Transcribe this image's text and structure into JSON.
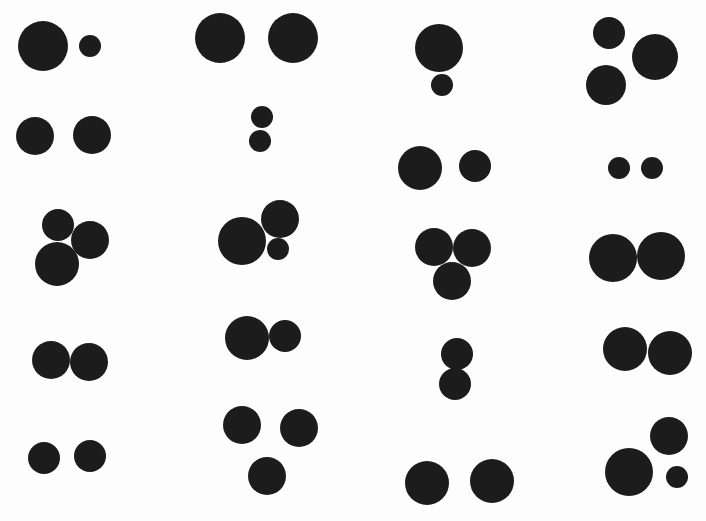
{
  "figure": {
    "background": "#fdfdfd",
    "dot_color": "#1c1c1c",
    "width": 706,
    "height": 521
  },
  "groups": [
    {
      "row": 1,
      "col": 1,
      "dots": [
        {
          "cx": 43,
          "cy": 46,
          "r": 25
        },
        {
          "cx": 90,
          "cy": 46,
          "r": 11
        }
      ]
    },
    {
      "row": 1,
      "col": 2,
      "dots": [
        {
          "cx": 220,
          "cy": 38,
          "r": 25
        },
        {
          "cx": 293,
          "cy": 38,
          "r": 25
        }
      ]
    },
    {
      "row": 1,
      "col": 3,
      "dots": [
        {
          "cx": 439,
          "cy": 48,
          "r": 24
        },
        {
          "cx": 442,
          "cy": 85,
          "r": 11
        }
      ]
    },
    {
      "row": 1,
      "col": 4,
      "dots": [
        {
          "cx": 609,
          "cy": 33,
          "r": 16
        },
        {
          "cx": 655,
          "cy": 57,
          "r": 23
        },
        {
          "cx": 606,
          "cy": 85,
          "r": 20
        }
      ]
    },
    {
      "row": 2,
      "col": 1,
      "dots": [
        {
          "cx": 35,
          "cy": 136,
          "r": 19
        },
        {
          "cx": 92,
          "cy": 135,
          "r": 19
        }
      ]
    },
    {
      "row": 2,
      "col": 2,
      "dots": [
        {
          "cx": 262,
          "cy": 117,
          "r": 11
        },
        {
          "cx": 260,
          "cy": 141,
          "r": 11
        }
      ]
    },
    {
      "row": 2,
      "col": 3,
      "dots": [
        {
          "cx": 420,
          "cy": 168,
          "r": 22
        },
        {
          "cx": 475,
          "cy": 166,
          "r": 16
        }
      ]
    },
    {
      "row": 2,
      "col": 4,
      "dots": [
        {
          "cx": 619,
          "cy": 168,
          "r": 11
        },
        {
          "cx": 652,
          "cy": 168,
          "r": 11
        }
      ]
    },
    {
      "row": 3,
      "col": 1,
      "dots": [
        {
          "cx": 58,
          "cy": 225,
          "r": 16
        },
        {
          "cx": 90,
          "cy": 240,
          "r": 19
        },
        {
          "cx": 57,
          "cy": 264,
          "r": 22
        }
      ]
    },
    {
      "row": 3,
      "col": 2,
      "dots": [
        {
          "cx": 242,
          "cy": 241,
          "r": 24
        },
        {
          "cx": 280,
          "cy": 219,
          "r": 19
        },
        {
          "cx": 278,
          "cy": 249,
          "r": 11
        }
      ]
    },
    {
      "row": 3,
      "col": 3,
      "dots": [
        {
          "cx": 434,
          "cy": 247,
          "r": 19
        },
        {
          "cx": 472,
          "cy": 248,
          "r": 19
        },
        {
          "cx": 452,
          "cy": 281,
          "r": 19
        }
      ]
    },
    {
      "row": 3,
      "col": 4,
      "dots": [
        {
          "cx": 613,
          "cy": 258,
          "r": 24
        },
        {
          "cx": 661,
          "cy": 256,
          "r": 24
        }
      ]
    },
    {
      "row": 4,
      "col": 1,
      "dots": [
        {
          "cx": 51,
          "cy": 360,
          "r": 19
        },
        {
          "cx": 89,
          "cy": 362,
          "r": 19
        }
      ]
    },
    {
      "row": 4,
      "col": 2,
      "dots": [
        {
          "cx": 247,
          "cy": 338,
          "r": 22
        },
        {
          "cx": 285,
          "cy": 336,
          "r": 16
        }
      ]
    },
    {
      "row": 4,
      "col": 3,
      "dots": [
        {
          "cx": 457,
          "cy": 354,
          "r": 16
        },
        {
          "cx": 455,
          "cy": 384,
          "r": 16
        }
      ]
    },
    {
      "row": 4,
      "col": 4,
      "dots": [
        {
          "cx": 625,
          "cy": 349,
          "r": 22
        },
        {
          "cx": 670,
          "cy": 353,
          "r": 22
        }
      ]
    },
    {
      "row": 5,
      "col": 1,
      "dots": [
        {
          "cx": 44,
          "cy": 458,
          "r": 16
        },
        {
          "cx": 90,
          "cy": 456,
          "r": 16
        }
      ]
    },
    {
      "row": 5,
      "col": 2,
      "dots": [
        {
          "cx": 242,
          "cy": 425,
          "r": 19
        },
        {
          "cx": 299,
          "cy": 428,
          "r": 19
        },
        {
          "cx": 267,
          "cy": 476,
          "r": 19
        }
      ]
    },
    {
      "row": 5,
      "col": 3,
      "dots": [
        {
          "cx": 427,
          "cy": 483,
          "r": 22
        },
        {
          "cx": 492,
          "cy": 481,
          "r": 22
        }
      ]
    },
    {
      "row": 5,
      "col": 4,
      "dots": [
        {
          "cx": 629,
          "cy": 472,
          "r": 24
        },
        {
          "cx": 669,
          "cy": 436,
          "r": 19
        },
        {
          "cx": 677,
          "cy": 477,
          "r": 11
        }
      ]
    }
  ]
}
